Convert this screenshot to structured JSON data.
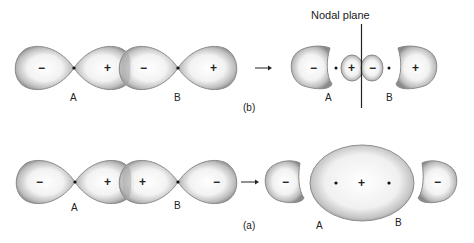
{
  "figure": {
    "panel_b": {
      "label": "(b)",
      "left_atom_label": "A",
      "right_atom_label": "B",
      "input_lobe_signs": [
        "−",
        "+",
        "−",
        "+"
      ],
      "result_lobe_signs": [
        "−",
        "+",
        "−",
        "+"
      ],
      "nodal_plane_label": "Nodal plane",
      "product_atom_label_a": "A",
      "product_atom_label_b": "B"
    },
    "panel_a": {
      "label": "(a)",
      "left_atom_label": "A",
      "right_atom_label": "B",
      "input_lobe_signs": [
        "−",
        "+",
        "+",
        "−"
      ],
      "result_lobe_signs": [
        "−",
        "+",
        "−"
      ],
      "product_atom_label_a": "A",
      "product_atom_label_b": "B"
    },
    "arrow_glyph": "→",
    "colors": {
      "lobe_edge": "#8a8a8a",
      "lobe_center": "#ffffff",
      "text": "#222222",
      "nucleus": "#111111"
    }
  }
}
